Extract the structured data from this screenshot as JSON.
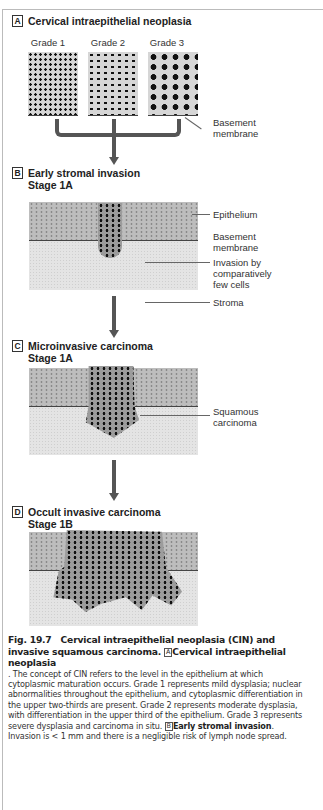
{
  "figure": {
    "panels": [
      {
        "letter": "A",
        "title": "Cervical intraepithelial neoplasia",
        "grades": [
          "Grade 1",
          "Grade 2",
          "Grade 3"
        ],
        "labels": [
          "Basement membrane"
        ]
      },
      {
        "letter": "B",
        "title": "Early stromal invasion",
        "stage": "Stage 1A",
        "labels": [
          "Epithelium",
          "Basement membrane",
          "Invasion by comparatively few cells",
          "Stroma"
        ]
      },
      {
        "letter": "C",
        "title": "Microinvasive carcinoma",
        "stage": "Stage 1A",
        "labels": [
          "Squamous carcinoma"
        ]
      },
      {
        "letter": "D",
        "title": "Occult invasive carcinoma",
        "stage": "Stage 1B",
        "labels": []
      }
    ],
    "label_text": {
      "basement_a_1": "Basement",
      "basement_a_2": "membrane",
      "epithelium": "Epithelium",
      "basement_b_1": "Basement",
      "basement_b_2": "membrane",
      "invasion_1": "Invasion by",
      "invasion_2": "comparatively",
      "invasion_3": "few cells",
      "stroma": "Stroma",
      "squamous_1": "Squamous",
      "squamous_2": "carcinoma"
    }
  },
  "caption": {
    "fig_number": "Fig. 19.7",
    "title": "Cervical intraepithelial neoplasia (CIN) and invasive squamous carcinoma.",
    "a_box": "A",
    "a_heading": "Cervical intraepithelial neoplasia",
    "a_text": ". The concept of CIN refers to the level in the epithelium at which cytoplasmic maturation occurs. Grade 1 represents mild dysplasia; nuclear abnormalities throughout the epithelium, and cytoplasmic differentiation in the upper two-thirds are present. Grade 2 represents moderate dysplasia, with differentiation in the upper third of the epithelium. Grade 3 represents severe dysplasia and carcinoma in situ.",
    "b_box": "B",
    "b_heading": "Early stromal invasion",
    "b_text": ". Invasion is < 1 mm and there is a negligible risk of lymph node spread."
  }
}
